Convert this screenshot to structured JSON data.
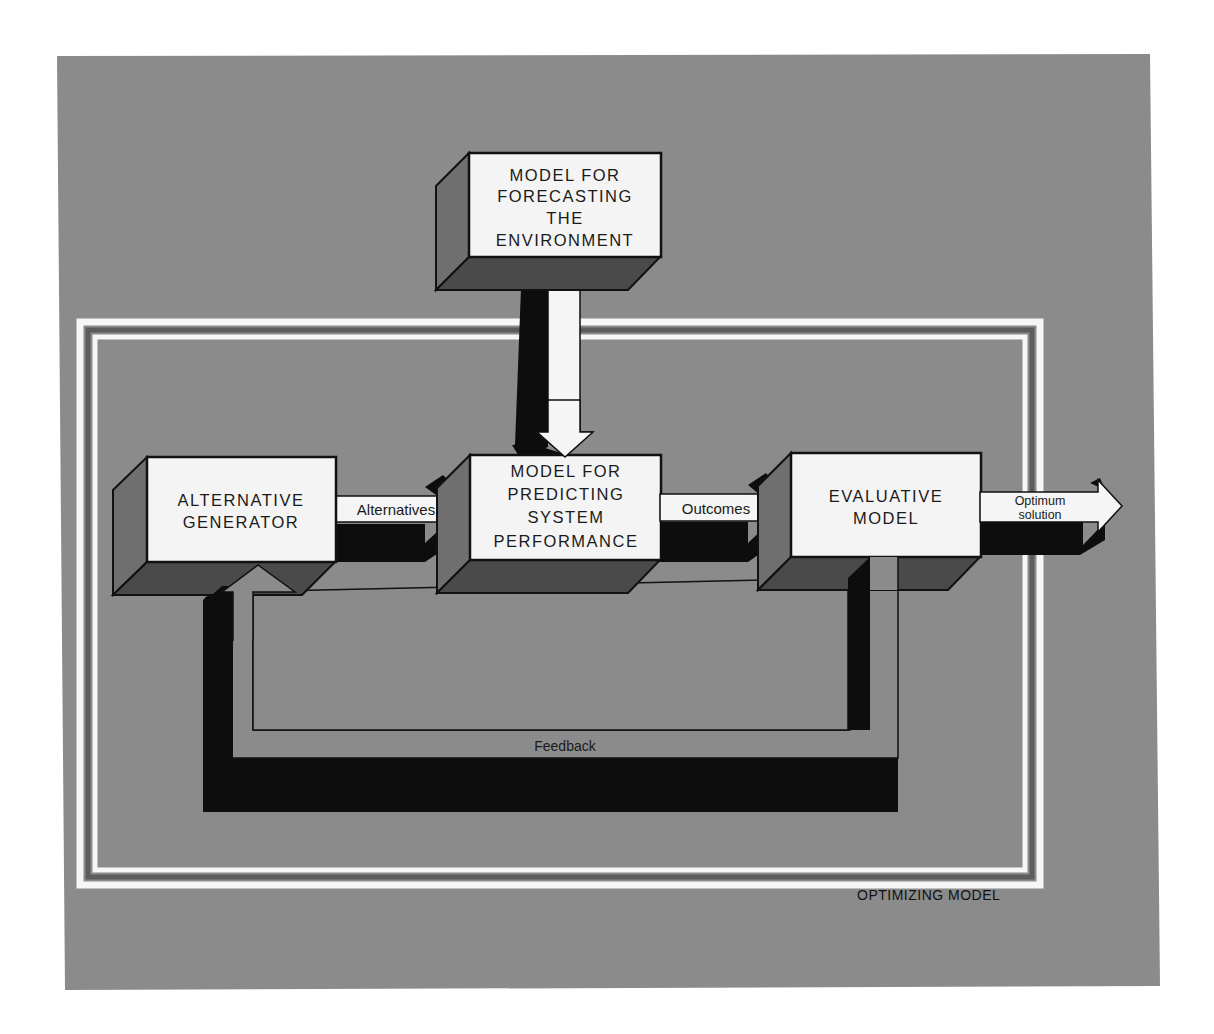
{
  "colors": {
    "page_background": "#ffffff",
    "panel": "#8b8b8b",
    "box_face": "#f4f4f4",
    "box_side": "#6f6f6f",
    "box_bottom": "#4a4a4a",
    "shadow": "#0d0d0d",
    "frame_light": "#f6f6f6",
    "frame_dark": "#5c5c5c",
    "arrow_fill": "#f5f5f5",
    "feedback_fill": "#8b8b8b"
  },
  "diagram": {
    "boxes": {
      "forecasting": {
        "lines": [
          "MODEL FOR",
          "FORECASTING",
          "THE",
          "ENVIRONMENT"
        ]
      },
      "generator": {
        "lines": [
          "ALTERNATIVE",
          "GENERATOR"
        ]
      },
      "predicting": {
        "lines": [
          "MODEL FOR",
          "PREDICTING",
          "SYSTEM",
          "PERFORMANCE"
        ]
      },
      "evaluative": {
        "lines": [
          "EVALUATIVE",
          "MODEL"
        ]
      }
    },
    "arrows": {
      "alternatives": "Alternatives",
      "outcomes": "Outcomes",
      "optimum_line1": "Optimum",
      "optimum_line2": "solution",
      "feedback": "Feedback"
    },
    "frame_caption": "OPTIMIZING MODEL"
  }
}
